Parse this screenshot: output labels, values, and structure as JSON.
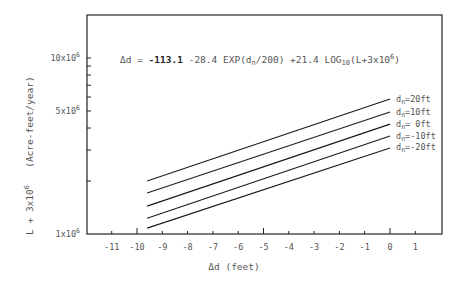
{
  "chart_data": {
    "type": "line",
    "equation": {
      "prefix": "Δd = ",
      "bold_part": "-113.1",
      "mid1": " -28.4 EXP(d",
      "sub1": "n",
      "mid2": "/200) +21.4 LOG",
      "sub2": "10",
      "mid3": "(L+3x10",
      "sup": "6",
      "end": ")"
    },
    "xlabel": "Δd (feet)",
    "ylabel": "L + 3x10^6   (Acre-feet/year)",
    "ylabel_parts": {
      "main": "L + 3x10",
      "sup": "6",
      "units": "(Acre-feet/year)"
    },
    "xlim": [
      -12,
      2
    ],
    "ylim": [
      1000000,
      14000000
    ],
    "yscale": "log",
    "x_ticks": [
      -11,
      -10,
      -9,
      -8,
      -7,
      -6,
      -5,
      -4,
      -3,
      -2,
      -1,
      0,
      1
    ],
    "x_tick_labels": [
      "-11",
      "-10",
      "-9",
      "-8",
      "-7",
      "-6",
      "-5",
      "-4",
      "-3",
      "-2",
      "-1",
      "0",
      "1"
    ],
    "y_tick_labels": [
      {
        "value": 1000000,
        "base": "1x10",
        "sup": "6"
      },
      {
        "value": 5000000,
        "base": "5x10",
        "sup": "6"
      },
      {
        "value": 10000000,
        "base": "10x10",
        "sup": "6"
      }
    ],
    "grid": false,
    "legend_position": "inline-right",
    "series": [
      {
        "name": "dn=20ft",
        "label_base": "d",
        "label_sub": "n",
        "label_rest": "=20ft",
        "x": [
          -9.6,
          0
        ],
        "values": [
          2000000,
          5850000
        ]
      },
      {
        "name": "dn=10ft",
        "label_base": "d",
        "label_sub": "n",
        "label_rest": "=10ft",
        "x": [
          -9.6,
          0
        ],
        "values": [
          1710000,
          4940000
        ]
      },
      {
        "name": "dn=0ft",
        "label_base": "d",
        "label_sub": "n",
        "label_rest": "= 0ft",
        "x": [
          -9.6,
          0
        ],
        "values": [
          1440000,
          4210000
        ]
      },
      {
        "name": "dn=-10ft",
        "label_base": "d",
        "label_sub": "n",
        "label_rest": "=-10ft",
        "x": [
          -9.6,
          0
        ],
        "values": [
          1230000,
          3600000
        ]
      },
      {
        "name": "dn=-20ft",
        "label_base": "d",
        "label_sub": "n",
        "label_rest": "=-20ft",
        "x": [
          -9.6,
          0
        ],
        "values": [
          1080000,
          3080000
        ]
      }
    ]
  }
}
